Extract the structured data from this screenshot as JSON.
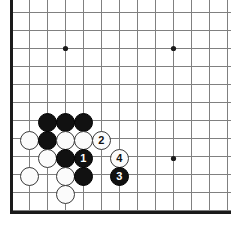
{
  "diagram": {
    "kind": "go-board-diagram",
    "board": {
      "columns": 12,
      "rows": 11,
      "origin_x": 11,
      "origin_y": 12,
      "spacing": 18,
      "line_color": "#808080",
      "edge_color": "#1a1a1a",
      "background_color": "#ffffff",
      "edge_left_x": 11,
      "edge_bottom_y": 212
    },
    "star_points": [
      {
        "name": "star-point-top-left",
        "x": 65,
        "y": 48
      },
      {
        "name": "star-point-top-right",
        "x": 173,
        "y": 48
      },
      {
        "name": "star-point-bottom-right",
        "x": 173,
        "y": 158
      }
    ],
    "colors": {
      "black_stone": "#111111",
      "white_stone": "#fbfbfb",
      "white_stone_outline": "#3a3a3a",
      "black_label_text": "#ffffff",
      "white_label_text": "#101010"
    },
    "stones": [
      {
        "name": "black-stone-a",
        "color": "black",
        "x": 47,
        "y": 122,
        "label": ""
      },
      {
        "name": "black-stone-b",
        "color": "black",
        "x": 65,
        "y": 122,
        "label": ""
      },
      {
        "name": "black-stone-c",
        "color": "black",
        "x": 83,
        "y": 122,
        "label": ""
      },
      {
        "name": "white-stone-a",
        "color": "white",
        "x": 29,
        "y": 140,
        "label": ""
      },
      {
        "name": "black-stone-d",
        "color": "black",
        "x": 47,
        "y": 140,
        "label": ""
      },
      {
        "name": "white-stone-b",
        "color": "white",
        "x": 65,
        "y": 140,
        "label": ""
      },
      {
        "name": "white-stone-c",
        "color": "white",
        "x": 83,
        "y": 140,
        "label": ""
      },
      {
        "name": "white-stone-move-2",
        "color": "white",
        "x": 101,
        "y": 140,
        "label": "2"
      },
      {
        "name": "white-stone-d",
        "color": "white",
        "x": 47,
        "y": 158,
        "label": ""
      },
      {
        "name": "black-stone-e",
        "color": "black",
        "x": 65,
        "y": 158,
        "label": ""
      },
      {
        "name": "black-stone-move-1",
        "color": "black",
        "x": 83,
        "y": 158,
        "label": "1"
      },
      {
        "name": "white-stone-move-4",
        "color": "white",
        "x": 119,
        "y": 158,
        "label": "4"
      },
      {
        "name": "white-stone-e",
        "color": "white",
        "x": 29,
        "y": 176,
        "label": ""
      },
      {
        "name": "white-stone-f",
        "color": "white",
        "x": 65,
        "y": 176,
        "label": ""
      },
      {
        "name": "black-stone-f",
        "color": "black",
        "x": 83,
        "y": 176,
        "label": ""
      },
      {
        "name": "black-stone-move-3",
        "color": "black",
        "x": 119,
        "y": 176,
        "label": "3"
      },
      {
        "name": "white-stone-g",
        "color": "white",
        "x": 65,
        "y": 194,
        "label": ""
      }
    ],
    "stone_radius": 9.5
  }
}
